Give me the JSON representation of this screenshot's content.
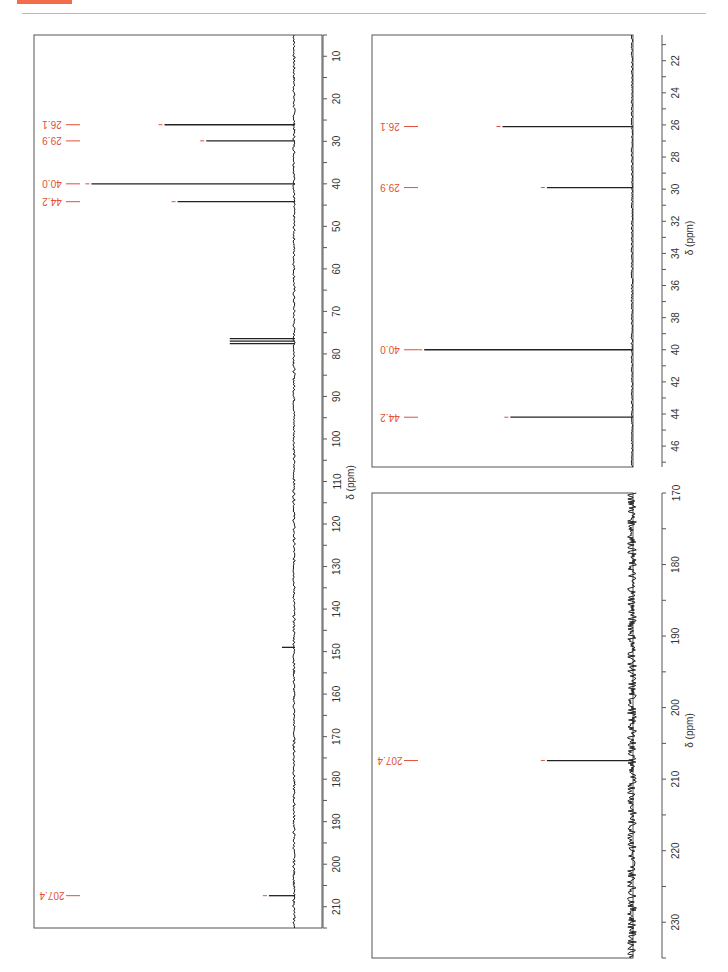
{
  "header": {
    "accent_color": "#f26b4a",
    "rule_color": "#f4a38c"
  },
  "colors": {
    "peak_label": "#e0503a",
    "spectrum": "#222222",
    "frame": "#555555"
  },
  "chart_data": [
    {
      "type": "line",
      "title": "13C NMR spectrum (full range)",
      "orientation": "rotated 90° (ppm axis vertical, intensity horizontal leftward)",
      "xlabel": "δ (ppm)",
      "xlim": [
        5,
        215
      ],
      "ticks": [
        10,
        20,
        30,
        40,
        50,
        60,
        70,
        80,
        90,
        100,
        110,
        120,
        130,
        140,
        150,
        160,
        170,
        180,
        190,
        200,
        210
      ],
      "peaks": [
        {
          "ppm": 26.1,
          "label": "26.1",
          "rel_intensity": 0.5
        },
        {
          "ppm": 29.9,
          "label": "29.9",
          "rel_intensity": 0.34
        },
        {
          "ppm": 40.0,
          "label": "40.0",
          "rel_intensity": 0.78
        },
        {
          "ppm": 44.2,
          "label": "44.2",
          "rel_intensity": 0.45
        },
        {
          "ppm": 77.0,
          "label": "",
          "rel_intensity": 0.25,
          "note": "CDCl3 solvent triplet"
        },
        {
          "ppm": 149.0,
          "label": "",
          "rel_intensity": 0.05
        },
        {
          "ppm": 207.4,
          "label": "207.4",
          "rel_intensity": 0.1
        }
      ],
      "grid": false
    },
    {
      "type": "line",
      "title": "13C NMR expansion 20–47 ppm",
      "xlabel": "δ (ppm)",
      "xlim": [
        20.4,
        47.3
      ],
      "ticks": [
        22,
        24,
        26,
        28,
        30,
        32,
        34,
        36,
        38,
        40,
        42,
        44,
        46
      ],
      "peaks": [
        {
          "ppm": 26.1,
          "label": "26.1",
          "rel_intensity": 0.5
        },
        {
          "ppm": 29.9,
          "label": "29.9",
          "rel_intensity": 0.33
        },
        {
          "ppm": 40.0,
          "label": "40.0",
          "rel_intensity": 0.8
        },
        {
          "ppm": 44.2,
          "label": "44.2",
          "rel_intensity": 0.47
        }
      ],
      "grid": false
    },
    {
      "type": "line",
      "title": "13C NMR expansion 170–235 ppm",
      "xlabel": "δ (ppm)",
      "xlim": [
        170,
        235
      ],
      "ticks": [
        170,
        180,
        190,
        200,
        210,
        220,
        230
      ],
      "peaks": [
        {
          "ppm": 207.4,
          "label": "207.4",
          "rel_intensity": 0.33
        }
      ],
      "grid": false
    }
  ]
}
